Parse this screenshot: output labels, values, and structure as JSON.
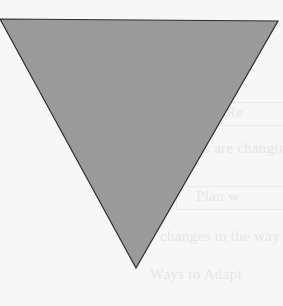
{
  "figure": {
    "shape": "inverted-triangle",
    "fill_color": "#9a9a9a",
    "stroke_color": "#2e2e2e",
    "background_color": "#f7f7f7"
  },
  "background_text": {
    "lines": [
      "Re",
      "lines are changing",
      "Plan w",
      "changes in the way",
      "Ways to Adapt"
    ]
  }
}
